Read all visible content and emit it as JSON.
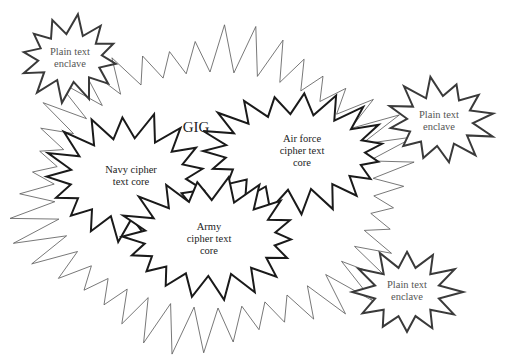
{
  "title": "GIG",
  "colors": {
    "background": "#ffffff",
    "gig_stroke": "#555555",
    "core_stroke": "#1a1a1a",
    "enclave_stroke": "#3a3a3a"
  },
  "gig": {
    "label": "GIG",
    "label_pos": [
      196,
      127
    ],
    "shape": {
      "cx": 214,
      "cy": 190,
      "rx_out": 196,
      "ry_out": 155,
      "rx_in": 160,
      "ry_in": 118,
      "points": 42,
      "rot": 0.05,
      "stroke_width": 0.8
    }
  },
  "cores": [
    {
      "id": "navy",
      "label": "Navy cipher\ntext core",
      "label_pos": [
        131,
        176
      ],
      "shape": {
        "cx": 128,
        "cy": 178,
        "rx_out": 82,
        "ry_out": 62,
        "rx_in": 58,
        "ry_in": 40,
        "points": 17,
        "rot": 0.3,
        "stroke_width": 2
      }
    },
    {
      "id": "air_force",
      "label": "Air force\ncipher text\ncore",
      "label_pos": [
        302,
        151
      ],
      "shape": {
        "cx": 295,
        "cy": 152,
        "rx_out": 92,
        "ry_out": 58,
        "rx_in": 70,
        "ry_in": 38,
        "points": 19,
        "rot": 0.1,
        "stroke_width": 2
      }
    },
    {
      "id": "army",
      "label": "Army\ncipher text\ncore",
      "label_pos": [
        209,
        239
      ],
      "shape": {
        "cx": 210,
        "cy": 238,
        "rx_out": 88,
        "ry_out": 58,
        "rx_in": 66,
        "ry_in": 38,
        "points": 18,
        "rot": 0.2,
        "stroke_width": 2
      }
    }
  ],
  "enclaves": [
    {
      "id": "enclave_top_left",
      "label": "Plain text\nenclave",
      "label_pos": [
        70,
        58
      ],
      "shape": {
        "cx": 70,
        "cy": 58,
        "rx_out": 50,
        "ry_out": 42,
        "rx_in": 32,
        "ry_in": 24,
        "points": 12,
        "rot": 0.15,
        "stroke_width": 2
      }
    },
    {
      "id": "enclave_right",
      "label": "Plain text\nenclave",
      "label_pos": [
        439,
        121
      ],
      "shape": {
        "cx": 440,
        "cy": 121,
        "rx_out": 52,
        "ry_out": 42,
        "rx_in": 33,
        "ry_in": 25,
        "points": 12,
        "rot": 0.35,
        "stroke_width": 2
      }
    },
    {
      "id": "enclave_bottom_right",
      "label": "Plain text\nenclave",
      "label_pos": [
        407,
        291
      ],
      "shape": {
        "cx": 407,
        "cy": 292,
        "rx_out": 52,
        "ry_out": 43,
        "rx_in": 33,
        "ry_in": 25,
        "points": 12,
        "rot": 0.0,
        "stroke_width": 2
      }
    }
  ]
}
